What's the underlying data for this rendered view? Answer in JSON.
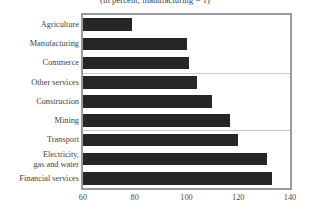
{
  "chart_data": {
    "type": "bar",
    "orientation": "horizontal",
    "title": "(in percent; manufacturing = 1)",
    "xlabel": "",
    "ylabel": "",
    "xlim": [
      60,
      140
    ],
    "xticks": [
      60,
      80,
      100,
      120,
      140
    ],
    "grid": false,
    "legend": null,
    "categories": [
      "Agriculture",
      "Manufacturing",
      "Commerce",
      "Other services",
      "Construction",
      "Mining",
      "Transport",
      "Electricity, gas and water",
      "Financial services"
    ],
    "category_lines": [
      [
        "Agriculture"
      ],
      [
        "Manufacturing"
      ],
      [
        "Commerce"
      ],
      [
        "Other services"
      ],
      [
        "Construction"
      ],
      [
        "Mining"
      ],
      [
        "Transport"
      ],
      [
        "Electricity,",
        "gas and water"
      ],
      [
        "Financial services"
      ]
    ],
    "values": [
      79,
      100,
      101,
      104,
      110,
      117,
      120,
      131,
      133
    ],
    "group_separators_after": [
      3,
      6
    ],
    "colors": {
      "bar": "#262626",
      "frame": "#9a9a9a",
      "separator": "#c9c9c9",
      "text": "#3f3f3f",
      "background": "#ffffff"
    }
  }
}
